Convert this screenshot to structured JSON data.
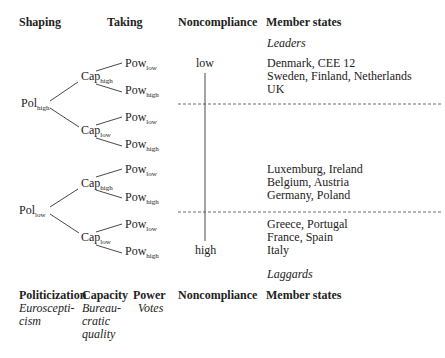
{
  "headers": {
    "shaping": "Shaping",
    "taking": "Taking",
    "noncompliance": "Noncompliance",
    "member_states": "Member states"
  },
  "labels": {
    "leaders": "Leaders",
    "laggards": "Laggards",
    "noncompliance_low": "low",
    "noncompliance_high": "high"
  },
  "tree": {
    "pol_high": {
      "base": "Pol",
      "sub": "high"
    },
    "pol_low": {
      "base": "Pol",
      "sub": "low"
    },
    "cap_high": {
      "base": "Cap",
      "sub": "high"
    },
    "cap_low": {
      "base": "Cap",
      "sub": "low"
    },
    "pow_low": {
      "base": "Pow",
      "sub": "low"
    },
    "pow_high": {
      "base": "Pow",
      "sub": "high"
    }
  },
  "member_groups": [
    {
      "lines": [
        "Denmark, CEE 12",
        "Sweden, Finland, Netherlands",
        "UK"
      ]
    },
    {
      "lines": [
        "Luxemburg, Ireland",
        "Belgium, Austria",
        "Germany, Poland"
      ]
    },
    {
      "lines": [
        "Greece, Portugal",
        "France, Spain",
        "Italy"
      ]
    }
  ],
  "legend": {
    "headers": [
      "Politicization",
      "Capacity",
      "Power",
      "Noncompliance",
      "Member states"
    ],
    "politicization": [
      "Euroscepti-",
      "cism"
    ],
    "capacity": [
      "Bureau-",
      "cratic",
      "quality"
    ],
    "power": [
      "Votes"
    ]
  }
}
